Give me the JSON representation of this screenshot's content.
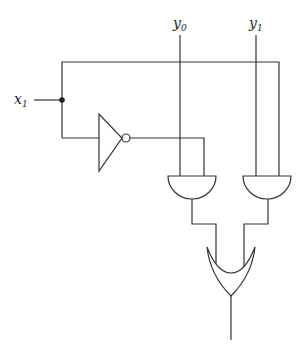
{
  "diagram": {
    "type": "logic-circuit",
    "inputs": [
      {
        "id": "x1",
        "base": "x",
        "sub": "1"
      },
      {
        "id": "y0",
        "base": "y",
        "sub": "0"
      },
      {
        "id": "y1",
        "base": "y",
        "sub": "1"
      }
    ],
    "gates": [
      {
        "id": "not1",
        "type": "NOT",
        "input": "x1"
      },
      {
        "id": "and1",
        "type": "AND",
        "inputs": [
          "y0",
          "not1"
        ]
      },
      {
        "id": "and2",
        "type": "AND",
        "inputs": [
          "y1",
          "x1"
        ]
      },
      {
        "id": "or1",
        "type": "OR",
        "inputs": [
          "and1",
          "and2"
        ]
      }
    ],
    "colors": {
      "stroke": "#333333",
      "background": "#ffffff"
    }
  }
}
